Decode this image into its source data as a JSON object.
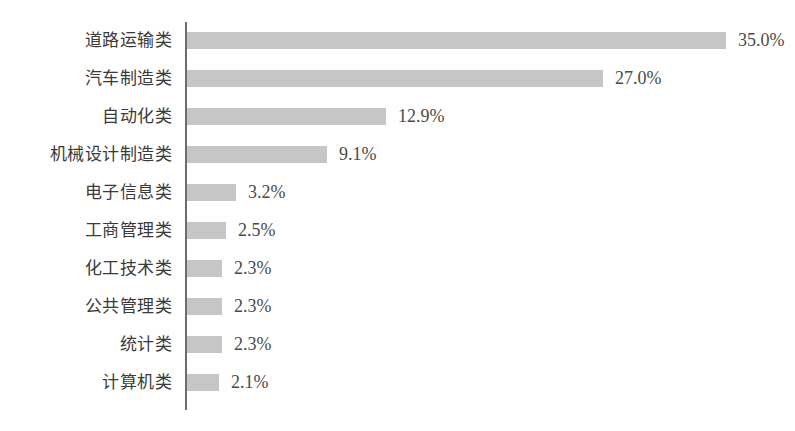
{
  "chart_data": {
    "type": "bar",
    "orientation": "horizontal",
    "title": "",
    "subtitle": "",
    "xlabel": "",
    "ylabel": "",
    "grid": false,
    "legend": false,
    "legend_position": "none",
    "axis_visible": {
      "x": false,
      "y": true
    },
    "xlim": [
      0,
      35
    ],
    "categories": [
      "道路运输类",
      "汽车制造类",
      "自动化类",
      "机械设计制造类",
      "电子信息类",
      "工商管理类",
      "化工技术类",
      "公共管理类",
      "统计类",
      "计算机类"
    ],
    "values": [
      35.0,
      27.0,
      12.9,
      9.1,
      3.2,
      2.5,
      2.3,
      2.3,
      2.3,
      2.1
    ],
    "value_labels": [
      "35.0%",
      "27.0%",
      "12.9%",
      "9.1%",
      "3.2%",
      "2.5%",
      "2.3%",
      "2.3%",
      "2.3%",
      "2.1%"
    ],
    "unit": "%"
  },
  "style": {
    "bar_color": "#c6c6c6",
    "axis_color": "#6d6d6d",
    "label_color": "#3a3a3a",
    "value_color": "#4a4a4a",
    "background": "#ffffff"
  },
  "rows": [
    {
      "label": "道路运输类",
      "value": 35.0,
      "value_label": "35.0%"
    },
    {
      "label": "汽车制造类",
      "value": 27.0,
      "value_label": "27.0%"
    },
    {
      "label": "自动化类",
      "value": 12.9,
      "value_label": "12.9%"
    },
    {
      "label": "机械设计制造类",
      "value": 9.1,
      "value_label": "9.1%"
    },
    {
      "label": "电子信息类",
      "value": 3.2,
      "value_label": "3.2%"
    },
    {
      "label": "工商管理类",
      "value": 2.5,
      "value_label": "2.5%"
    },
    {
      "label": "化工技术类",
      "value": 2.3,
      "value_label": "2.3%"
    },
    {
      "label": "公共管理类",
      "value": 2.3,
      "value_label": "2.3%"
    },
    {
      "label": "统计类",
      "value": 2.3,
      "value_label": "2.3%"
    },
    {
      "label": "计算机类",
      "value": 2.1,
      "value_label": "2.1%"
    }
  ]
}
